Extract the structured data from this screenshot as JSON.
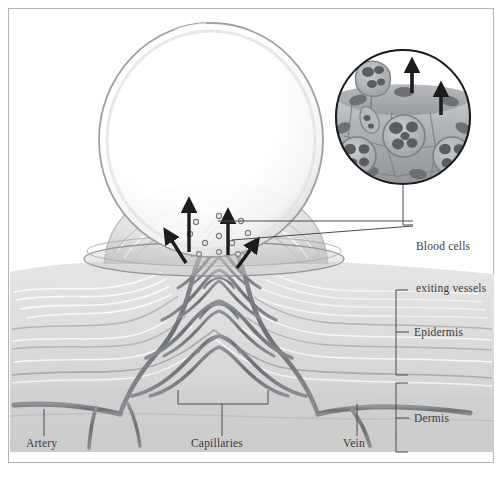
{
  "figure": {
    "frame_color": "#b4b4b4",
    "background": "#ffffff"
  },
  "labels": {
    "blood_cells": "Blood cells\nexiting vessels",
    "blood_cells_line1": "Blood cells",
    "blood_cells_line2": "exiting vessels",
    "epidermis": "Epidermis",
    "dermis": "Dermis",
    "artery": "Artery",
    "capillaries": "Capillaries",
    "vein": "Vein"
  },
  "colors": {
    "ink": "#3b3b3b",
    "leader": "#4a4a4a",
    "vessel_dark": "#6f7378",
    "vessel_mid": "#8d9196",
    "skin_light": "#ececec",
    "skin_mid": "#d8d8d8",
    "skin_dark": "#b8b8b8",
    "blister_rim": "#9a9a9a",
    "blister_fill": "#ffffff",
    "inset_ring": "#1a1a1a",
    "arrow": "#1c1c1c",
    "cell_nucleus": "#5a5e63",
    "cell_body": "#a9adb2"
  },
  "regions": {
    "blister": {
      "name": "blister dome",
      "cx": 211,
      "cy": 140,
      "rx": 113,
      "ry": 118
    },
    "inner_mound": {
      "name": "raised epidermal mound",
      "cx": 216,
      "cy": 253,
      "rx": 108,
      "ry": 62
    },
    "base_ellipse": {
      "name": "blister base ring",
      "cx": 214,
      "cy": 258,
      "rx": 130,
      "ry": 17
    },
    "inset": {
      "name": "magnified vessel wall inset",
      "cx": 403,
      "cy": 117,
      "r": 68
    }
  },
  "annotations": {
    "arrow_count_main": 4,
    "arrow_count_inset": 2,
    "capillary_loop_count": 5,
    "inset_leukocyte_count": 4
  },
  "layers": [
    {
      "name": "Epidermis",
      "bracket_top": 290,
      "bracket_bottom": 375
    },
    {
      "name": "Dermis",
      "bracket_top": 383,
      "bracket_bottom": 452
    }
  ],
  "vessels": [
    {
      "name": "Artery",
      "side": "left"
    },
    {
      "name": "Capillaries",
      "side": "center"
    },
    {
      "name": "Vein",
      "side": "right"
    }
  ]
}
